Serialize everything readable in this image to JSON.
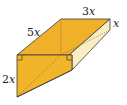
{
  "diagram": {
    "type": "triangular prism (wedge) 3D figure",
    "labels": {
      "slant_edge": "5x",
      "length": "3x",
      "depth": "x",
      "height": "2x"
    },
    "right_angle_markers": 2,
    "colors": {
      "front_face": "#f2b429",
      "top_face": "#f0b02a",
      "right_face": "#fbecc4",
      "edge": "#3a3a3a",
      "hidden_edge": "#555555"
    }
  }
}
